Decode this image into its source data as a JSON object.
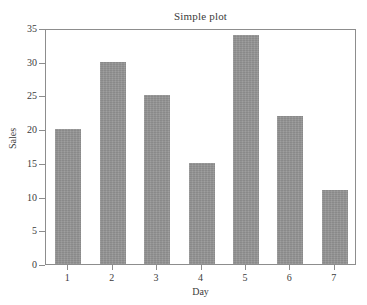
{
  "chart_data": {
    "type": "bar",
    "title": "Simple plot",
    "xlabel": "Day",
    "ylabel": "Sales",
    "categories": [
      "1",
      "2",
      "3",
      "4",
      "5",
      "6",
      "7"
    ],
    "values": [
      20,
      30,
      25,
      15,
      34,
      22,
      11
    ],
    "ylim": [
      0,
      35
    ],
    "yticks": [
      0,
      5,
      10,
      15,
      20,
      25,
      30,
      35
    ],
    "ytick_labels": [
      "0",
      "5",
      "10",
      "15",
      "20",
      "25",
      "30",
      "35"
    ],
    "xtick_labels": [
      "1",
      "2",
      "3",
      "4",
      "5",
      "6",
      "7"
    ],
    "grid": false,
    "legend": null,
    "bar_color": "#939393",
    "frame_color": "#8d8d8d",
    "background_color": "#ffffff",
    "text_color": "#3b3b3b"
  }
}
